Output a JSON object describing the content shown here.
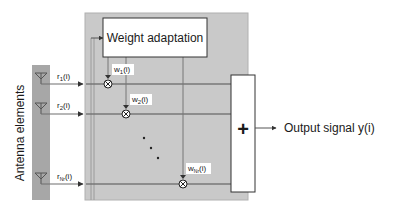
{
  "diagram": {
    "title_block": "Weight adaptation",
    "antenna_label": "Antenna elements",
    "summation_symbol": "+",
    "output_label": "Output signal y(i)",
    "ellipsis": "...",
    "inputs": [
      {
        "sym": "r",
        "sub": "1",
        "arg": "(i)"
      },
      {
        "sym": "r",
        "sub": "2",
        "arg": "(i)"
      },
      {
        "sym": "r",
        "sub": "Nr",
        "arg": "(i)"
      }
    ],
    "weights": [
      {
        "sym": "w",
        "sub": "1",
        "arg": "(i)"
      },
      {
        "sym": "w",
        "sub": "2",
        "arg": "(i)"
      },
      {
        "sym": "w",
        "sub": "Nr",
        "arg": "(i)"
      }
    ],
    "colors": {
      "panel": "#c8c8c8",
      "panel_border": "#a8a8a8",
      "antenna_strip": "#a6a6a6",
      "line": "#6e6e6e",
      "box_fill": "#ffffff",
      "box_border": "#333333"
    }
  }
}
